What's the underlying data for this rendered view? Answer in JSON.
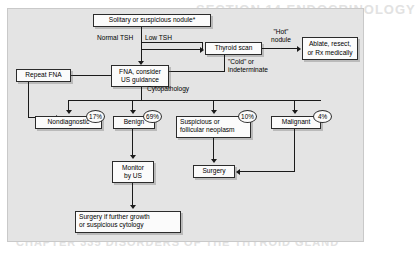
{
  "figure": {
    "type": "clinical-algorithm-flowchart",
    "bleed_text_top": "SECTION 14  ENDOCRINOLOGY",
    "bleed_text_bottom": "CHAPTER 335  DISORDERS OF THE THYROID GLAND"
  },
  "nodes": {
    "nodule": "Solitary or suspicious nodule*",
    "fna": "FNA, consider\nUS guidance",
    "fna_line1": "FNA, consider",
    "fna_line2": "US guidance",
    "thyroid_scan": "Thyroid scan",
    "ablate": "Ablate, resect,\nor Rx medically",
    "ablate_line1": "Ablate, resect,",
    "ablate_line2": "or Rx medically",
    "repeat_fna": "Repeat FNA",
    "nondiagnostic": "Nondiagnostic",
    "benign": "Benign",
    "suspicious": "Suspicious or\nfollicular neoplasm",
    "suspicious_line1": "Suspicious or",
    "suspicious_line2": "follicular neoplasm",
    "malignant": "Malignant",
    "monitor": "Monitor\nby US",
    "monitor_line1": "Monitor",
    "monitor_line2": "by US",
    "surgery": "Surgery",
    "surgery_growth": "Surgery if further growth\nor suspicious cytology",
    "surgery_growth_line1": "Surgery if further growth",
    "surgery_growth_line2": "or suspicious cytology"
  },
  "edge_labels": {
    "normal_tsh": "Normal TSH",
    "low_tsh": "Low TSH",
    "hot_nodule_line1": "\"Hot\"",
    "hot_nodule_line2": "nodule",
    "cold_line1": "\"Cold\" or",
    "cold_line2": "indeterminate",
    "cytopathology": "Cytopathology"
  },
  "percentages": {
    "nondiagnostic": "17%",
    "benign": "69%",
    "suspicious": "10%",
    "malignant": "4%"
  },
  "colors": {
    "panel_background": "#e4e4e4",
    "box_fill": "#fbfbfb",
    "line": "#1a1a1a",
    "text": "#000000"
  }
}
